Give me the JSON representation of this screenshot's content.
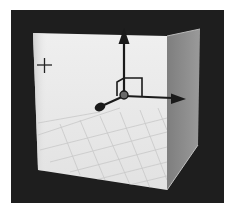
{
  "scene": {
    "description": "3D viewport gizmo icon: open box with grid floor and translate axes",
    "colors": {
      "background": "#ffffff",
      "frame": "#1e1e1e",
      "front_face": "#e9e9e9",
      "right_face": "#8a8a8a",
      "grid_line": "#cfcfcf",
      "axis": "#1a1a1a"
    },
    "icons": [
      {
        "name": "crosshair-icon",
        "glyph": "+"
      },
      {
        "name": "y-axis-arrow-icon",
        "direction": "up"
      },
      {
        "name": "x-axis-arrow-icon",
        "direction": "right"
      },
      {
        "name": "z-axis-handle-icon",
        "direction": "toward-viewer"
      },
      {
        "name": "plane-handle-icon",
        "shape": "square"
      }
    ]
  }
}
